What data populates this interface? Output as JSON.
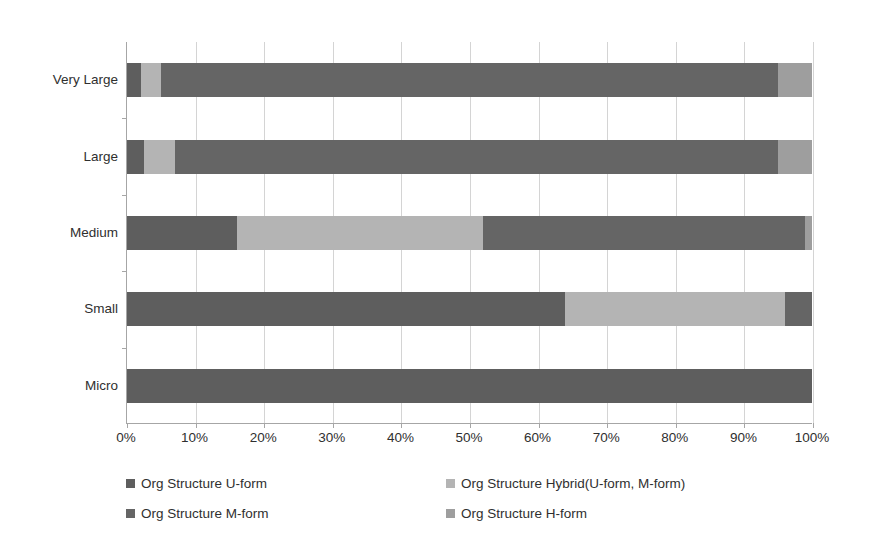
{
  "chart_data": {
    "type": "bar",
    "orientation": "horizontal",
    "stacked": true,
    "normalized": "percent",
    "title": "",
    "xlabel": "",
    "ylabel": "",
    "xlim": [
      0,
      100
    ],
    "grid": true,
    "legend_position": "bottom",
    "categories": [
      "Micro",
      "Small",
      "Medium",
      "Large",
      "Very Large"
    ],
    "categories_top_to_bottom": [
      "Very Large",
      "Large",
      "Medium",
      "Small",
      "Micro"
    ],
    "xticks": [
      "0%",
      "10%",
      "20%",
      "30%",
      "40%",
      "50%",
      "60%",
      "70%",
      "80%",
      "90%",
      "100%"
    ],
    "xtick_values": [
      0,
      10,
      20,
      30,
      40,
      50,
      60,
      70,
      80,
      90,
      100
    ],
    "series": [
      {
        "name": "Org Structure U-form",
        "color": "#5e5e5e",
        "values_top_to_bottom": [
          2,
          2.5,
          16,
          64,
          100
        ]
      },
      {
        "name": "Org Structure Hybrid(U-form, M-form)",
        "color": "#b4b4b4",
        "values_top_to_bottom": [
          3,
          4.5,
          36,
          32,
          0
        ]
      },
      {
        "name": "Org Structure M-form",
        "color": "#656565",
        "values_top_to_bottom": [
          90,
          88,
          47,
          4,
          0
        ]
      },
      {
        "name": "Org Structure H-form",
        "color": "#9e9e9e",
        "values_top_to_bottom": [
          5,
          5,
          1,
          0,
          0
        ]
      }
    ],
    "bars": [
      {
        "category": "Very Large",
        "segments": [
          {
            "series": "Org Structure U-form",
            "value": 2,
            "color": "#5e5e5e"
          },
          {
            "series": "Org Structure Hybrid(U-form, M-form)",
            "value": 3,
            "color": "#b4b4b4"
          },
          {
            "series": "Org Structure M-form",
            "value": 90,
            "color": "#656565"
          },
          {
            "series": "Org Structure H-form",
            "value": 5,
            "color": "#9e9e9e"
          }
        ]
      },
      {
        "category": "Large",
        "segments": [
          {
            "series": "Org Structure U-form",
            "value": 2.5,
            "color": "#5e5e5e"
          },
          {
            "series": "Org Structure Hybrid(U-form, M-form)",
            "value": 4.5,
            "color": "#b4b4b4"
          },
          {
            "series": "Org Structure M-form",
            "value": 88,
            "color": "#656565"
          },
          {
            "series": "Org Structure H-form",
            "value": 5,
            "color": "#9e9e9e"
          }
        ]
      },
      {
        "category": "Medium",
        "segments": [
          {
            "series": "Org Structure U-form",
            "value": 16,
            "color": "#5e5e5e"
          },
          {
            "series": "Org Structure Hybrid(U-form, M-form)",
            "value": 36,
            "color": "#b4b4b4"
          },
          {
            "series": "Org Structure M-form",
            "value": 47,
            "color": "#656565"
          },
          {
            "series": "Org Structure H-form",
            "value": 1,
            "color": "#9e9e9e"
          }
        ]
      },
      {
        "category": "Small",
        "segments": [
          {
            "series": "Org Structure U-form",
            "value": 64,
            "color": "#5e5e5e"
          },
          {
            "series": "Org Structure Hybrid(U-form, M-form)",
            "value": 32,
            "color": "#b4b4b4"
          },
          {
            "series": "Org Structure M-form",
            "value": 4,
            "color": "#656565"
          },
          {
            "series": "Org Structure H-form",
            "value": 0,
            "color": "#9e9e9e"
          }
        ]
      },
      {
        "category": "Micro",
        "segments": [
          {
            "series": "Org Structure U-form",
            "value": 100,
            "color": "#5e5e5e"
          },
          {
            "series": "Org Structure Hybrid(U-form, M-form)",
            "value": 0,
            "color": "#b4b4b4"
          },
          {
            "series": "Org Structure M-form",
            "value": 0,
            "color": "#656565"
          },
          {
            "series": "Org Structure H-form",
            "value": 0,
            "color": "#9e9e9e"
          }
        ]
      }
    ],
    "legend": [
      {
        "label": "Org Structure U-form",
        "color": "#5e5e5e"
      },
      {
        "label": "Org Structure Hybrid(U-form, M-form)",
        "color": "#b4b4b4"
      },
      {
        "label": "Org Structure M-form",
        "color": "#656565"
      },
      {
        "label": "Org Structure H-form",
        "color": "#9e9e9e"
      }
    ],
    "colors": {
      "u_form": "#5e5e5e",
      "hybrid": "#b4b4b4",
      "m_form": "#656565",
      "h_form": "#9e9e9e",
      "gridline": "#d4d4d4",
      "axis": "#a6a6a6",
      "text": "#2f2f2f",
      "background": "#ffffff"
    }
  }
}
